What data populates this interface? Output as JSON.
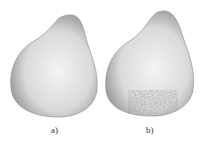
{
  "figure": {
    "panels": [
      {
        "id": "a",
        "label": "a)",
        "description": "smooth pear-shaped 3D surface"
      },
      {
        "id": "b",
        "label": "b)",
        "description": "pear-shaped 3D surface with surface noise/artifacts near bottom"
      }
    ],
    "colors": {
      "background": "#ffffff",
      "shape_light": "#f2f2f2",
      "shape_mid": "#cfcfcf",
      "shape_dark": "#6e6e6e"
    }
  }
}
